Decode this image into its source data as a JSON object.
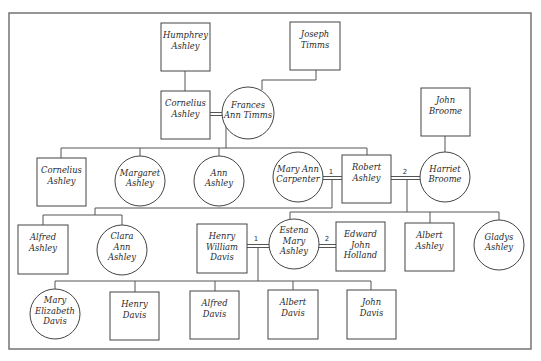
{
  "diagram": {
    "type": "family-tree",
    "frame": {
      "x": 9,
      "y": 13,
      "w": 522,
      "h": 336
    }
  },
  "people": [
    {
      "id": "humphrey",
      "name": [
        "Humphrey",
        "Ashley"
      ],
      "sex": "male",
      "x": 161,
      "y": 23,
      "w": 49,
      "h": 48
    },
    {
      "id": "joseph",
      "name": [
        "Joseph",
        "Timms"
      ],
      "sex": "male",
      "x": 290,
      "y": 22,
      "w": 50,
      "h": 48
    },
    {
      "id": "cornelius_sr",
      "name": [
        "Cornelius",
        "Ashley"
      ],
      "sex": "male",
      "x": 161,
      "y": 91,
      "w": 49,
      "h": 48
    },
    {
      "id": "frances",
      "name": [
        "Frances",
        "Ann Timms"
      ],
      "sex": "female",
      "cx": 248,
      "cy": 113,
      "r": 26
    },
    {
      "id": "john_broome",
      "name": [
        "John",
        "Broome"
      ],
      "sex": "male",
      "x": 421,
      "y": 88,
      "w": 49,
      "h": 48
    },
    {
      "id": "cornelius_jr",
      "name": [
        "Cornelius",
        "Ashley"
      ],
      "sex": "male",
      "x": 37,
      "y": 158,
      "w": 49,
      "h": 48
    },
    {
      "id": "margaret",
      "name": [
        "Margaret",
        "Ashley"
      ],
      "sex": "female",
      "cx": 140,
      "cy": 181,
      "r": 25
    },
    {
      "id": "ann",
      "name": [
        "Ann",
        "Ashley"
      ],
      "sex": "female",
      "cx": 219,
      "cy": 181,
      "r": 25
    },
    {
      "id": "mary_ann",
      "name": [
        "Mary Ann",
        "Carpenter"
      ],
      "sex": "female",
      "cx": 298,
      "cy": 177,
      "r": 25
    },
    {
      "id": "robert",
      "name": [
        "Robert",
        "Ashley"
      ],
      "sex": "male",
      "x": 342,
      "y": 155,
      "w": 49,
      "h": 48
    },
    {
      "id": "harriet",
      "name": [
        "Harriet",
        "Broome"
      ],
      "sex": "female",
      "cx": 445,
      "cy": 177,
      "r": 25
    },
    {
      "id": "alfred_ashley",
      "name": [
        "Alfred",
        "Ashley"
      ],
      "sex": "male",
      "x": 18,
      "y": 225,
      "w": 50,
      "h": 49
    },
    {
      "id": "clara",
      "name": [
        "Clara",
        "Ann",
        "Ashley"
      ],
      "sex": "female",
      "cx": 122,
      "cy": 250,
      "r": 25
    },
    {
      "id": "henry_wd",
      "name": [
        "Henry",
        "William",
        "Davis"
      ],
      "sex": "male",
      "x": 197,
      "y": 224,
      "w": 50,
      "h": 49
    },
    {
      "id": "estena",
      "name": [
        "Estena",
        "Mary",
        "Ashley"
      ],
      "sex": "female",
      "cx": 294,
      "cy": 244,
      "r": 25
    },
    {
      "id": "edward",
      "name": [
        "Edward",
        "John",
        "Holland"
      ],
      "sex": "male",
      "x": 336,
      "y": 222,
      "w": 49,
      "h": 49
    },
    {
      "id": "albert_ashley",
      "name": [
        "Albert",
        "Ashley"
      ],
      "sex": "male",
      "x": 405,
      "y": 223,
      "w": 49,
      "h": 48
    },
    {
      "id": "gladys",
      "name": [
        "Gladys",
        "Ashley"
      ],
      "sex": "female",
      "cx": 499,
      "cy": 245,
      "r": 25
    },
    {
      "id": "mary_elizabeth",
      "name": [
        "Mary",
        "Elizabeth",
        "Davis"
      ],
      "sex": "female",
      "cx": 55,
      "cy": 314,
      "r": 25
    },
    {
      "id": "henry_davis",
      "name": [
        "Henry",
        "Davis"
      ],
      "sex": "male",
      "x": 110,
      "y": 292,
      "w": 49,
      "h": 48
    },
    {
      "id": "alfred_davis",
      "name": [
        "Alfred",
        "Davis"
      ],
      "sex": "male",
      "x": 190,
      "y": 291,
      "w": 49,
      "h": 48
    },
    {
      "id": "albert_davis",
      "name": [
        "Albert",
        "Davis"
      ],
      "sex": "male",
      "x": 268,
      "y": 290,
      "w": 50,
      "h": 49
    },
    {
      "id": "john_davis",
      "name": [
        "John",
        "Davis"
      ],
      "sex": "male",
      "x": 347,
      "y": 290,
      "w": 49,
      "h": 49
    }
  ],
  "marriages": [
    {
      "id": "m_cornelius_frances",
      "x1": 210,
      "x2": 222,
      "y": 114,
      "label": ""
    },
    {
      "id": "m_maryann_robert",
      "x1": 323,
      "x2": 342,
      "y": 178,
      "label": "1",
      "label_x": 331,
      "label_y": 174
    },
    {
      "id": "m_robert_harriet",
      "x1": 391,
      "x2": 420,
      "y": 178,
      "label": "2",
      "label_x": 405,
      "label_y": 174
    },
    {
      "id": "m_henry_estena",
      "x1": 247,
      "x2": 269,
      "y": 246,
      "label": "1",
      "label_x": 256,
      "label_y": 241
    },
    {
      "id": "m_estena_edward",
      "x1": 319,
      "x2": 336,
      "y": 246,
      "label": "2",
      "label_x": 327,
      "label_y": 241
    }
  ],
  "lines": [
    {
      "note": "humphrey-to-cornelius",
      "points": [
        [
          185,
          71
        ],
        [
          185,
          91
        ]
      ]
    },
    {
      "note": "joseph-to-frances",
      "points": [
        [
          316,
          70
        ],
        [
          316,
          80
        ],
        [
          262,
          80
        ],
        [
          262,
          90
        ]
      ]
    },
    {
      "note": "john-broome-to-harriet",
      "points": [
        [
          445,
          136
        ],
        [
          445,
          152
        ]
      ]
    },
    {
      "note": "cornelius-frances-descent",
      "points": [
        [
          226,
          115
        ],
        [
          226,
          148
        ]
      ]
    },
    {
      "note": "gen2-sibling-bar",
      "points": [
        [
          61,
          148
        ],
        [
          367,
          148
        ]
      ]
    },
    {
      "note": "to-cornelius-jr",
      "points": [
        [
          61,
          148
        ],
        [
          61,
          158
        ]
      ]
    },
    {
      "note": "to-margaret",
      "points": [
        [
          140,
          148
        ],
        [
          140,
          156
        ]
      ]
    },
    {
      "note": "to-ann",
      "points": [
        [
          219,
          148
        ],
        [
          219,
          156
        ]
      ]
    },
    {
      "note": "to-robert",
      "points": [
        [
          367,
          148
        ],
        [
          367,
          155
        ]
      ]
    },
    {
      "note": "maryann-robert-descent",
      "points": [
        [
          332,
          180
        ],
        [
          332,
          208
        ]
      ]
    },
    {
      "note": "maryann-robert-children-bar",
      "points": [
        [
          95,
          208
        ],
        [
          332,
          208
        ]
      ]
    },
    {
      "note": "alfred-clara-bar",
      "points": [
        [
          43,
          215
        ],
        [
          122,
          215
        ]
      ]
    },
    {
      "note": "alfred-clara-drop",
      "points": [
        [
          95,
          208
        ],
        [
          95,
          215
        ]
      ]
    },
    {
      "note": "to-alfred-ashley",
      "points": [
        [
          43,
          215
        ],
        [
          43,
          225
        ]
      ]
    },
    {
      "note": "to-clara",
      "points": [
        [
          122,
          215
        ],
        [
          122,
          225
        ]
      ]
    },
    {
      "note": "robert-harriet-descent",
      "points": [
        [
          407,
          180
        ],
        [
          407,
          212
        ]
      ]
    },
    {
      "note": "robert-harriet-children-bar",
      "points": [
        [
          290,
          212
        ],
        [
          499,
          212
        ]
      ]
    },
    {
      "note": "to-estena",
      "points": [
        [
          290,
          212
        ],
        [
          290,
          219
        ]
      ]
    },
    {
      "note": "to-albert-ashley",
      "points": [
        [
          430,
          212
        ],
        [
          430,
          223
        ]
      ]
    },
    {
      "note": "to-gladys",
      "points": [
        [
          499,
          212
        ],
        [
          499,
          220
        ]
      ]
    },
    {
      "note": "henry-estena-descent",
      "points": [
        [
          258,
          248
        ],
        [
          258,
          281
        ]
      ]
    },
    {
      "note": "davis-children-bar",
      "points": [
        [
          55,
          281
        ],
        [
          371,
          281
        ]
      ]
    },
    {
      "note": "to-mary-elizabeth",
      "points": [
        [
          55,
          281
        ],
        [
          55,
          289
        ]
      ]
    },
    {
      "note": "to-henry-davis",
      "points": [
        [
          135,
          281
        ],
        [
          135,
          292
        ]
      ]
    },
    {
      "note": "to-alfred-davis",
      "points": [
        [
          215,
          281
        ],
        [
          215,
          291
        ]
      ]
    },
    {
      "note": "to-albert-davis",
      "points": [
        [
          293,
          281
        ],
        [
          293,
          290
        ]
      ]
    },
    {
      "note": "to-john-davis",
      "points": [
        [
          371,
          281
        ],
        [
          371,
          290
        ]
      ]
    }
  ]
}
